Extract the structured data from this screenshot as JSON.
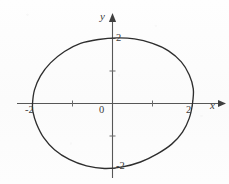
{
  "figure": {
    "kind": "cartesian-plot",
    "background_color": "#fcfcfc",
    "ink_color": "#3b3b3b",
    "axis_labels": {
      "x": "x",
      "y": "y"
    },
    "origin_label": "0",
    "tick_labels": {
      "x_negative_two": "-2",
      "x_positive_two": "2",
      "y_positive_two": "2",
      "y_negative_two": "-2"
    }
  },
  "chart_data": {
    "type": "line",
    "title": "",
    "xlabel": "x",
    "ylabel": "y",
    "grid": false,
    "legend": null,
    "xlim": [
      -2.4,
      2.75
    ],
    "ylim": [
      -2.2,
      2.2
    ],
    "x_ticks": [
      -2,
      -1,
      1,
      2
    ],
    "x_tick_labels": [
      "-2",
      "",
      "",
      "2"
    ],
    "y_ticks": [
      -2,
      -1,
      1,
      2
    ],
    "y_tick_labels": [
      "-2",
      "",
      "",
      "2"
    ],
    "origin_label": "0",
    "series": [
      {
        "name": "closed-oval-curve",
        "closed": true,
        "description": "egg-shaped closed curve passing through (-2,0), (2,0), (0.3,2), (-0.1,-2)",
        "points": [
          [
            -2.0,
            0.0
          ],
          [
            -1.95,
            0.42
          ],
          [
            -1.8,
            0.85
          ],
          [
            -1.55,
            1.25
          ],
          [
            -1.2,
            1.6
          ],
          [
            -0.8,
            1.85
          ],
          [
            -0.35,
            1.97
          ],
          [
            0.1,
            2.02
          ],
          [
            0.55,
            1.99
          ],
          [
            1.0,
            1.85
          ],
          [
            1.4,
            1.62
          ],
          [
            1.72,
            1.28
          ],
          [
            1.92,
            0.88
          ],
          [
            2.02,
            0.45
          ],
          [
            2.0,
            0.0
          ],
          [
            1.92,
            -0.45
          ],
          [
            1.75,
            -0.88
          ],
          [
            1.48,
            -1.25
          ],
          [
            1.12,
            -1.55
          ],
          [
            0.7,
            -1.8
          ],
          [
            0.25,
            -1.95
          ],
          [
            -0.2,
            -2.0
          ],
          [
            -0.65,
            -1.92
          ],
          [
            -1.08,
            -1.72
          ],
          [
            -1.45,
            -1.42
          ],
          [
            -1.72,
            -1.05
          ],
          [
            -1.9,
            -0.62
          ],
          [
            -1.99,
            -0.25
          ],
          [
            -2.0,
            0.0
          ]
        ]
      }
    ]
  }
}
